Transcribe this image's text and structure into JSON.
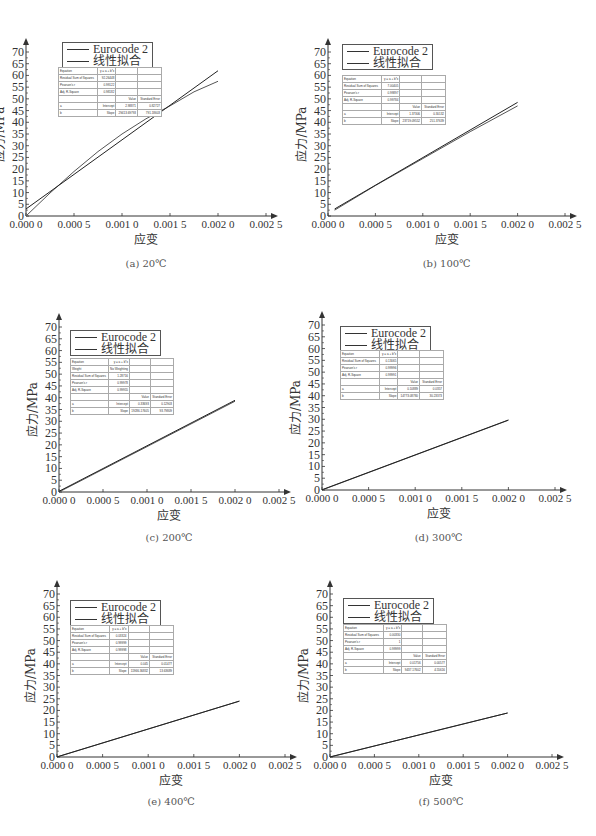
{
  "figure": {
    "panels": [
      {
        "caption": "(a) 20℃",
        "legend": [
          "Eurocode 2",
          "线性拟合"
        ],
        "stats": {
          "equation": "y = a + b*x",
          "weight": null,
          "rss": "92.26448",
          "pearson_r": "0.99122",
          "adj_r2": "0.98182",
          "intercept": "2.98871",
          "intercept_se": "0.82727",
          "slope": "29413.69793",
          "slope_se": "791.18603"
        }
      },
      {
        "caption": "(b) 100℃",
        "legend": [
          "Eurocode 2",
          "线性拟合"
        ],
        "stats": {
          "equation": "y = a + b*x",
          "weight": null,
          "rss": "7.00405",
          "pearson_r": "0.99897",
          "adj_r2": "0.99784",
          "intercept": "1.37306",
          "intercept_se": "0.30132",
          "slope": "23719.09552",
          "slope_se": "251.37639"
        }
      },
      {
        "caption": "(c) 200℃",
        "legend": [
          "Eurocode 2",
          "线性拟合"
        ],
        "stats": {
          "equation": "y = a + b*x",
          "weight": "No Weighting",
          "rss": "1.28716",
          "pearson_r": "0.99978",
          "adj_r2": "0.99955",
          "intercept": "0.33693",
          "intercept_se": "0.12903",
          "slope": "19286.17605",
          "slope_se": "93.79809"
        }
      },
      {
        "caption": "(d) 300℃",
        "legend": [
          "Eurocode 2",
          "线性拟合"
        ],
        "stats": {
          "equation": "y = a + b*x",
          "weight": null,
          "rss": "0.13065",
          "pearson_r": "0.99996",
          "adj_r2": "0.99991",
          "intercept": "0.10889",
          "intercept_se": "0.0357",
          "slope": "14773.08780",
          "slope_se": "30.23373"
        }
      },
      {
        "caption": "(e) 400℃",
        "legend": [
          "Eurocode 2",
          "线性拟合"
        ],
        "stats": {
          "equation": "y = a + b*x",
          "weight": null,
          "rss": "0.03324",
          "pearson_r": "0.99999",
          "adj_r2": "0.99998",
          "intercept": "0.045",
          "intercept_se": "0.01477",
          "slope": "11966.36832",
          "slope_se": "13.63689"
        }
      },
      {
        "caption": "(f) 500℃",
        "legend": [
          "Eurocode 2",
          "线性拟合"
        ],
        "stats": {
          "equation": "y = a + b*x",
          "weight": null,
          "rss": "0.00330",
          "pearson_r": "1",
          "adj_r2": "0.99999",
          "intercept": "0.01756",
          "intercept_se": "0.00577",
          "slope": "9437.17602",
          "slope_se": "4.55616"
        }
      }
    ],
    "stats_labels": {
      "equation": "Equation",
      "weight": "Weight",
      "rss": "Residual Sum of Squares",
      "pearson_r": "Pearson's r",
      "adj_r2": "Adj. R-Square",
      "value": "Value",
      "se": "Standard Error",
      "b": "b",
      "a": "a",
      "intercept": "Intercept",
      "slope": "Slope"
    }
  },
  "chart_data": [
    {
      "type": "line",
      "title": "(a) 20℃",
      "xlabel": "应变",
      "ylabel": "应力/MPa",
      "xlim": [
        0,
        0.0025
      ],
      "ylim": [
        0,
        70
      ],
      "xticks": [
        "0.000 0",
        "0.000 5",
        "0.001 0",
        "0.001 5",
        "0.002 0",
        "0.002 5"
      ],
      "yticks": [
        0,
        5,
        10,
        15,
        20,
        25,
        30,
        35,
        40,
        45,
        50,
        55,
        60,
        65,
        70
      ],
      "series": [
        {
          "name": "Eurocode 2",
          "x": [
            0,
            0.00025,
            0.0005,
            0.00075,
            0.001,
            0.00125,
            0.0015,
            0.00175,
            0.002
          ],
          "y": [
            0,
            9.8,
            19,
            27.5,
            35,
            41.5,
            47,
            53,
            57.5
          ]
        },
        {
          "name": "线性拟合",
          "x": [
            0,
            0.002
          ],
          "y": [
            3,
            62
          ]
        }
      ]
    },
    {
      "type": "line",
      "title": "(b) 100℃",
      "xlabel": "应变",
      "ylabel": "应力/MPa",
      "xlim": [
        0,
        0.0025
      ],
      "ylim": [
        0,
        70
      ],
      "xticks": [
        "0.000 0",
        "0.000 5",
        "0.001 0",
        "0.001 5",
        "0.002 0",
        "0.002 5"
      ],
      "yticks": [
        0,
        5,
        10,
        15,
        20,
        25,
        30,
        35,
        40,
        45,
        50,
        55,
        60,
        65,
        70
      ],
      "series": [
        {
          "name": "Eurocode 2",
          "x": [
            7e-05,
            0.0005,
            0.001,
            0.0015,
            0.002
          ],
          "y": [
            2.5,
            13,
            24.5,
            36,
            47
          ]
        },
        {
          "name": "线性拟合",
          "x": [
            7e-05,
            0.002
          ],
          "y": [
            3,
            48.5
          ]
        }
      ]
    },
    {
      "type": "line",
      "title": "(c) 200℃",
      "xlabel": "应变",
      "ylabel": "应力/MPa",
      "xlim": [
        0,
        0.0025
      ],
      "ylim": [
        0,
        70
      ],
      "xticks": [
        "0.000 0",
        "0.000 5",
        "0.001 0",
        "0.001 5",
        "0.002 0",
        "0.002 5"
      ],
      "yticks": [
        0,
        5,
        10,
        15,
        20,
        25,
        30,
        35,
        40,
        45,
        50,
        55,
        60,
        65,
        70
      ],
      "series": [
        {
          "name": "Eurocode 2",
          "x": [
            0,
            0.002
          ],
          "y": [
            0,
            38.5
          ]
        },
        {
          "name": "线性拟合",
          "x": [
            0,
            0.002
          ],
          "y": [
            0.3,
            38.9
          ]
        }
      ]
    },
    {
      "type": "line",
      "title": "(d) 300℃",
      "xlabel": "应变",
      "ylabel": "应力/MPa",
      "xlim": [
        0,
        0.0025
      ],
      "ylim": [
        0,
        70
      ],
      "xticks": [
        "0.000 0",
        "0.000 5",
        "0.001 0",
        "0.001 5",
        "0.002 0",
        "0.002 5"
      ],
      "yticks": [
        0,
        5,
        10,
        15,
        20,
        25,
        30,
        35,
        40,
        45,
        50,
        55,
        60,
        65,
        70
      ],
      "series": [
        {
          "name": "Eurocode 2",
          "x": [
            0,
            0.002
          ],
          "y": [
            0,
            29.6
          ]
        },
        {
          "name": "线性拟合",
          "x": [
            0,
            0.002
          ],
          "y": [
            0.1,
            29.7
          ]
        }
      ]
    },
    {
      "type": "line",
      "title": "(e) 400℃",
      "xlabel": "应变",
      "ylabel": "应力/MPa",
      "xlim": [
        0,
        0.0025
      ],
      "ylim": [
        0,
        70
      ],
      "xticks": [
        "0.000 0",
        "0.000 5",
        "0.001 0",
        "0.001 5",
        "0.002 0",
        "0.002 5"
      ],
      "yticks": [
        0,
        5,
        10,
        15,
        20,
        25,
        30,
        35,
        40,
        45,
        50,
        55,
        60,
        65,
        70
      ],
      "series": [
        {
          "name": "Eurocode 2",
          "x": [
            0,
            0.002
          ],
          "y": [
            0,
            24
          ]
        },
        {
          "name": "线性拟合",
          "x": [
            0,
            0.002
          ],
          "y": [
            0.05,
            24
          ]
        }
      ]
    },
    {
      "type": "line",
      "title": "(f) 500℃",
      "xlabel": "应变",
      "ylabel": "应力/MPa",
      "xlim": [
        0,
        0.0025
      ],
      "ylim": [
        0,
        70
      ],
      "xticks": [
        "0.000 0",
        "0.000 5",
        "0.001 0",
        "0.001 5",
        "0.002 0",
        "0.002 5"
      ],
      "yticks": [
        0,
        5,
        10,
        15,
        20,
        25,
        30,
        35,
        40,
        45,
        50,
        55,
        60,
        65,
        70
      ],
      "series": [
        {
          "name": "Eurocode 2",
          "x": [
            0,
            0.002
          ],
          "y": [
            0,
            18.9
          ]
        },
        {
          "name": "线性拟合",
          "x": [
            0,
            0.002
          ],
          "y": [
            0.02,
            18.9
          ]
        }
      ]
    }
  ]
}
